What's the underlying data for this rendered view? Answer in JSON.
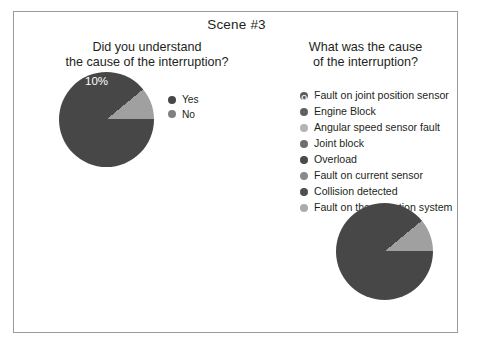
{
  "figure": {
    "title": "Scene #3",
    "background": "#ffffff",
    "border_color": "#9a9a9a"
  },
  "colors": {
    "slice_dark": "#474747",
    "slice_light": "#a0a0a0",
    "label_text": "#ffffff",
    "text": "#231f20"
  },
  "panels": {
    "left": {
      "question_line1": "Did you understand",
      "question_line2": "the cause of the interruption?",
      "legend": [
        {
          "label": "Yes",
          "color": "#474747"
        },
        {
          "label": "No",
          "color": "#808080"
        }
      ],
      "labels": {
        "major": "90%",
        "minor": "10%"
      }
    },
    "right": {
      "question_line1": "What was the cause",
      "question_line2": "of the interruption?",
      "legend": [
        {
          "label": "Fault on joint position sensor",
          "color": "#5a5a5a"
        },
        {
          "label": "Engine Block",
          "color": "#5f5f5f"
        },
        {
          "label": "Angular speed sensor fault",
          "color": "#b4b4b4"
        },
        {
          "label": "Joint block",
          "color": "#6e6e6e"
        },
        {
          "label": "Overload",
          "color": "#4b4b4b"
        },
        {
          "label": "Fault on current sensor",
          "color": "#8a8a8a"
        },
        {
          "label": "Collision detected",
          "color": "#4f4f4f"
        },
        {
          "label": "Fault on the actuation system",
          "color": "#ababab"
        }
      ],
      "labels": {
        "major": "89.9%",
        "minor": "11.1%"
      }
    }
  },
  "chart_data": [
    {
      "type": "pie",
      "title": "Did you understand the cause of the interruption?",
      "categories": [
        "Yes",
        "No"
      ],
      "values": [
        90,
        11.1
      ],
      "data_labels": [
        "90%",
        "10%"
      ],
      "unit": "percent",
      "legend_position": "right",
      "colors": [
        "#474747",
        "#a0a0a0"
      ],
      "start_angle_deg": 0,
      "direction": "clockwise"
    },
    {
      "type": "pie",
      "title": "What was the cause of the interruption?",
      "categories": [
        "Fault on joint position sensor",
        "Engine Block",
        "Angular speed sensor fault",
        "Joint block",
        "Overload",
        "Fault on current sensor",
        "Collision detected",
        "Fault on the actuation system"
      ],
      "values": [
        89.9,
        0,
        11.1,
        0,
        0,
        0,
        0,
        0
      ],
      "data_labels": [
        "89.9%",
        "11.1%"
      ],
      "visible_slices": [
        {
          "label": "89.9%",
          "value": 89.9,
          "color": "#474747"
        },
        {
          "label": "11.1%",
          "value": 11.1,
          "color": "#a0a0a0"
        }
      ],
      "unit": "percent",
      "legend_position": "top",
      "start_angle_deg": 0,
      "direction": "clockwise"
    }
  ]
}
